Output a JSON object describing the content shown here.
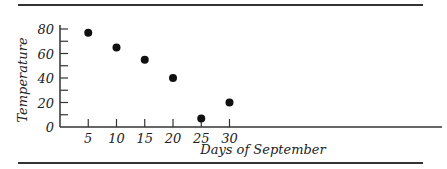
{
  "chart_data": {
    "type": "scatter",
    "title": "",
    "xlabel": "Days of September",
    "ylabel": "Temperature",
    "x": [
      5,
      10,
      15,
      20,
      25,
      30
    ],
    "y": [
      77,
      65,
      55,
      40,
      7,
      20
    ],
    "xticks": [
      "5",
      "10",
      "15",
      "20",
      "25",
      "30"
    ],
    "yticks": [
      "0",
      "20",
      "40",
      "60",
      "80"
    ],
    "xlim": [
      0,
      33
    ],
    "ylim": [
      0,
      85
    ],
    "grid": false,
    "legend": null
  }
}
